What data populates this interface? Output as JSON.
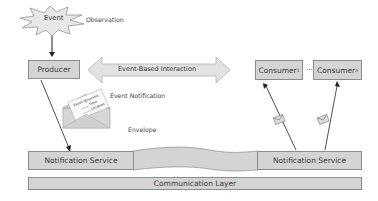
{
  "event": {
    "label": "Event",
    "annotation": "Observation"
  },
  "producer": {
    "label": "Producer"
  },
  "interaction": {
    "label": "Event-Based Interaction"
  },
  "consumers": [
    {
      "label": "Consumer",
      "subscript": "1"
    },
    {
      "label": "Consumer",
      "subscript": "n"
    }
  ],
  "ellipsis": "...",
  "notification": {
    "label": "Event Notification",
    "envelope_label": "Envelope",
    "card_lines": [
      "Event observed",
      "Time",
      "Location"
    ]
  },
  "notification_services": [
    {
      "label": "Notification Service"
    },
    {
      "label": "Notification Service"
    }
  ],
  "communication_layer": {
    "label": "Communication Layer"
  },
  "colors": {
    "box_fill": "#d4d4d4",
    "box_border": "#8c8c8c",
    "arrow_fill": "#e2e2e2",
    "line": "#333333"
  }
}
